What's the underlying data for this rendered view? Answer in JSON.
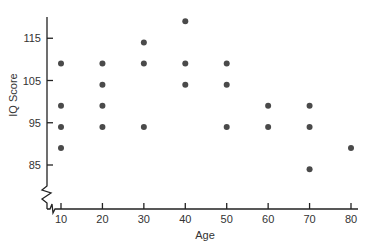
{
  "chart_data": {
    "type": "scatter",
    "title": "",
    "xlabel": "Age",
    "ylabel": "IQ Score",
    "x_ticks": [
      10,
      20,
      30,
      40,
      50,
      60,
      70,
      80
    ],
    "y_ticks": [
      85,
      95,
      105,
      115
    ],
    "xlim": [
      8,
      82
    ],
    "ylim": [
      75,
      120
    ],
    "y_axis_break": true,
    "x_axis_break": true,
    "grid": false,
    "legend": null,
    "point_color": "#4a4a4a",
    "points": [
      {
        "x": 10,
        "y": 109
      },
      {
        "x": 10,
        "y": 99
      },
      {
        "x": 10,
        "y": 94
      },
      {
        "x": 10,
        "y": 89
      },
      {
        "x": 20,
        "y": 109
      },
      {
        "x": 20,
        "y": 104
      },
      {
        "x": 20,
        "y": 99
      },
      {
        "x": 20,
        "y": 94
      },
      {
        "x": 30,
        "y": 114
      },
      {
        "x": 30,
        "y": 109
      },
      {
        "x": 30,
        "y": 94
      },
      {
        "x": 40,
        "y": 119
      },
      {
        "x": 40,
        "y": 109
      },
      {
        "x": 40,
        "y": 104
      },
      {
        "x": 50,
        "y": 109
      },
      {
        "x": 50,
        "y": 104
      },
      {
        "x": 50,
        "y": 94
      },
      {
        "x": 60,
        "y": 99
      },
      {
        "x": 60,
        "y": 94
      },
      {
        "x": 70,
        "y": 99
      },
      {
        "x": 70,
        "y": 94
      },
      {
        "x": 70,
        "y": 84
      },
      {
        "x": 80,
        "y": 89
      }
    ]
  }
}
